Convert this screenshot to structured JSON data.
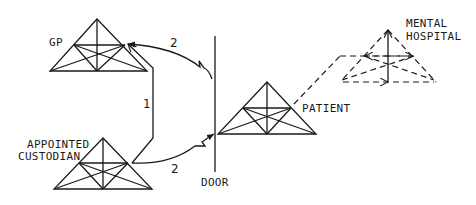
{
  "diagram": {
    "nodes": [
      {
        "id": "gp",
        "label": "GP"
      },
      {
        "id": "custodian",
        "label_line1": "APPOINTED",
        "label_line2": "CUSTODIAN"
      },
      {
        "id": "patient",
        "label": "PATIENT"
      },
      {
        "id": "hospital",
        "label_line1": "MENTAL",
        "label_line2": "HOSPITAL",
        "style": "dashed"
      }
    ],
    "door": {
      "label": "DOOR"
    },
    "edges": [
      {
        "from": "custodian",
        "to": "gp",
        "label": "1"
      },
      {
        "from": "door",
        "to": "gp",
        "label": "2"
      },
      {
        "from": "custodian",
        "to": "door",
        "label": "2"
      }
    ],
    "colors": {
      "line": "#1a1a1a",
      "background": "#ffffff"
    }
  }
}
